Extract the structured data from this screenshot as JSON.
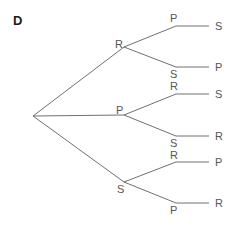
{
  "figure": {
    "panel_label": "D",
    "line_color": "#707070",
    "text_color": "#555555"
  },
  "tree": {
    "level1": [
      {
        "label": "R",
        "children": [
          {
            "label": "P",
            "leaf": "S"
          },
          {
            "label": "S",
            "leaf": "P"
          }
        ]
      },
      {
        "label": "P",
        "children": [
          {
            "label": "R",
            "leaf": "S"
          },
          {
            "label": "S",
            "leaf": "R"
          }
        ]
      },
      {
        "label": "S",
        "children": [
          {
            "label": "R",
            "leaf": "P"
          },
          {
            "label": "P",
            "leaf": "R"
          }
        ]
      }
    ]
  }
}
